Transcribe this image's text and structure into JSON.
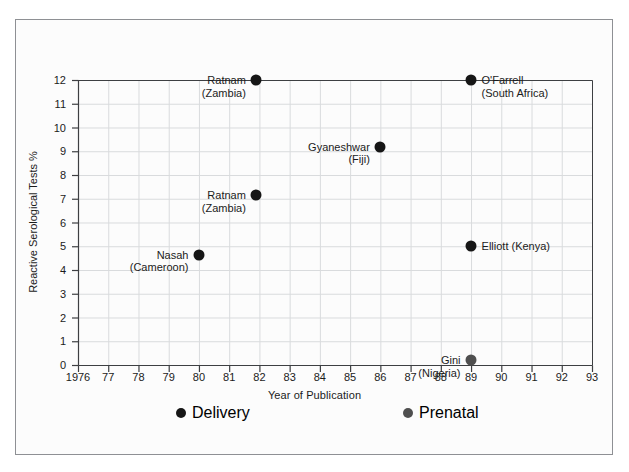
{
  "chart_data": {
    "type": "scatter",
    "title": "",
    "xlabel": "Year of Publication",
    "ylabel": "Reactive Serological Tests  %",
    "xlim": [
      1976,
      1993
    ],
    "ylim": [
      0,
      12
    ],
    "grid": true,
    "legend_position": "below-axis",
    "xtick_labels": [
      "1976",
      "77",
      "78",
      "79",
      "80",
      "81",
      "82",
      "83",
      "84",
      "85",
      "86",
      "87",
      "88",
      "89",
      "90",
      "91",
      "92",
      "93"
    ],
    "xtick_values": [
      1976,
      1977,
      1978,
      1979,
      1980,
      1981,
      1982,
      1983,
      1984,
      1985,
      1986,
      1987,
      1988,
      1989,
      1990,
      1991,
      1992,
      1993
    ],
    "ytick_labels": [
      "0",
      "1",
      "2",
      "3",
      "4",
      "5",
      "6",
      "7",
      "8",
      "9",
      "10",
      "11",
      "12"
    ],
    "ytick_values": [
      0,
      1,
      2,
      3,
      4,
      5,
      6,
      7,
      8,
      9,
      10,
      11,
      12
    ],
    "legend": [
      {
        "name": "Delivery",
        "color": "#161616"
      },
      {
        "name": "Prenatal",
        "color": "#4f4f4f"
      }
    ],
    "series": [
      {
        "name": "Delivery",
        "color": "#161616",
        "points": [
          {
            "label": "Ratnam\n(Zambia)",
            "label_line1": "Ratnam",
            "label_line2": "(Zambia)",
            "x": 1981.9,
            "y": 12.0,
            "label_side": "left"
          },
          {
            "label": "O'Farrell\n(South Africa)",
            "label_line1": "O'Farrell",
            "label_line2": "(South Africa)",
            "x": 1989.0,
            "y": 12.0,
            "label_side": "right"
          },
          {
            "label": "Gyaneshwar\n(Fiji)",
            "label_line1": "Gyaneshwar",
            "label_line2": "(Fiji)",
            "x": 1986.0,
            "y": 9.2,
            "label_side": "left"
          },
          {
            "label": "Ratnam\n(Zambia)",
            "label_line1": "Ratnam",
            "label_line2": "(Zambia)",
            "x": 1981.9,
            "y": 7.15,
            "label_side": "left"
          },
          {
            "label": "Elliott (Kenya)",
            "label_line1": "Elliott (Kenya)",
            "label_line2": "",
            "x": 1989.0,
            "y": 5.0,
            "label_side": "right"
          },
          {
            "label": "Nasah\n(Cameroon)",
            "label_line1": "Nasah",
            "label_line2": "(Cameroon)",
            "x": 1980.0,
            "y": 4.65,
            "label_side": "left"
          }
        ]
      },
      {
        "name": "Prenatal",
        "color": "#4f4f4f",
        "points": [
          {
            "label": "Gini\n(Nigeria)",
            "label_line1": "Gini",
            "label_line2": "(Nigeria)",
            "x": 1989.0,
            "y": 0.2,
            "label_side": "left"
          }
        ]
      }
    ]
  },
  "colors": {
    "frame": "#8e9094",
    "axis": "#3d3f42",
    "grid": "#d9dbdd",
    "text": "#1b1b1b",
    "background": "#fcfcfc",
    "delivery_marker": "#161616",
    "prenatal_marker": "#4f4f4f"
  }
}
